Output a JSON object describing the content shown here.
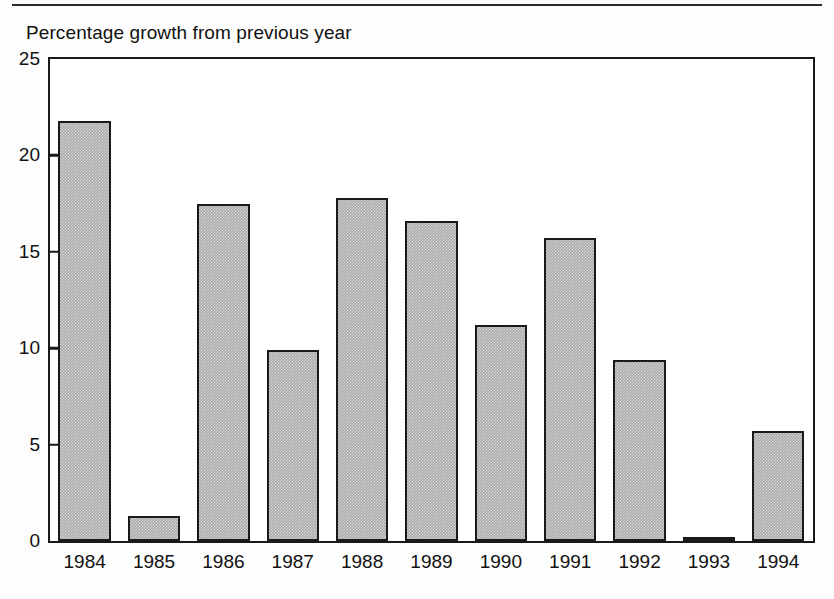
{
  "figure": {
    "title": "Percentage growth from previous year",
    "has_top_rule": true,
    "bar_fill_color": "#ababab",
    "bar_edge_color": "#1a1a1a",
    "axis_color": "#1a1a1a",
    "background_color": "#ffffff"
  },
  "chart_data": {
    "type": "bar",
    "title": "Percentage growth from previous year",
    "xlabel": "",
    "ylabel": "",
    "categories": [
      "1984",
      "1985",
      "1986",
      "1987",
      "1988",
      "1989",
      "1990",
      "1991",
      "1992",
      "1993",
      "1994"
    ],
    "values": [
      21.8,
      1.3,
      17.5,
      9.9,
      17.8,
      16.6,
      11.2,
      15.7,
      9.4,
      0.15,
      5.7
    ],
    "ylim": [
      0,
      25
    ],
    "yticks": [
      0,
      5,
      10,
      15,
      20,
      25
    ],
    "ytick_labels": [
      "0",
      "5",
      "10",
      "15",
      "20",
      "25"
    ],
    "grid": false,
    "legend": null
  }
}
